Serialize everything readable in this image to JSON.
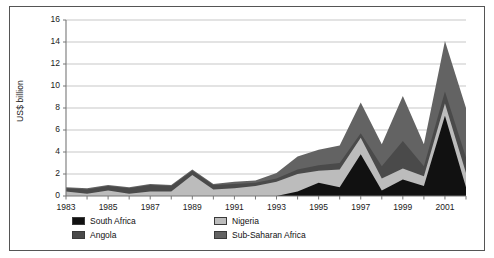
{
  "chart_data": {
    "type": "area",
    "title": "",
    "subtitle": "",
    "xlabel": "",
    "ylabel": "US$ billion",
    "ylim": [
      0,
      16
    ],
    "yticks": [
      0,
      2,
      4,
      6,
      8,
      10,
      12,
      14,
      16
    ],
    "ytick_labels": [
      "0",
      "2",
      "4",
      "6",
      "8",
      "10",
      "12",
      "14",
      "16"
    ],
    "xlim": [
      1983,
      2002
    ],
    "x": [
      1983,
      1984,
      1985,
      1986,
      1987,
      1988,
      1989,
      1990,
      1991,
      1992,
      1993,
      1994,
      1995,
      1996,
      1997,
      1998,
      1999,
      2000,
      2001,
      2002
    ],
    "xtick_labels": [
      "1983",
      "1985",
      "1987",
      "1989",
      "1991",
      "1993",
      "1995",
      "1997",
      "1999",
      "2001"
    ],
    "xticks_major": [
      1983,
      1985,
      1987,
      1989,
      1991,
      1993,
      1995,
      1997,
      1999,
      2001
    ],
    "grid": true,
    "grid_axis": "y",
    "legend_position": "below",
    "stacked": true,
    "stack_order": [
      "South Africa",
      "Nigeria",
      "Angola",
      "Sub-Saharan Africa"
    ],
    "series": [
      {
        "name": "South Africa",
        "color": "#111111",
        "values": [
          0.0,
          0.0,
          0.0,
          0.0,
          0.0,
          0.0,
          0.0,
          0.0,
          0.0,
          0.0,
          0.0,
          0.4,
          1.2,
          0.8,
          3.8,
          0.5,
          1.5,
          0.9,
          7.3,
          0.8
        ]
      },
      {
        "name": "Nigeria",
        "color": "#bcbcbc",
        "values": [
          0.4,
          0.2,
          0.5,
          0.2,
          0.4,
          0.4,
          1.9,
          0.6,
          0.7,
          0.9,
          1.3,
          1.6,
          1.1,
          1.6,
          1.5,
          1.1,
          1.0,
          0.9,
          1.1,
          1.3
        ]
      },
      {
        "name": "Angola",
        "color": "#4a4a4a",
        "values": [
          0.3,
          0.4,
          0.4,
          0.5,
          0.6,
          0.5,
          0.4,
          0.4,
          0.4,
          0.3,
          0.3,
          0.4,
          0.5,
          0.6,
          0.4,
          1.1,
          2.5,
          0.9,
          1.1,
          1.4
        ]
      },
      {
        "name": "Sub-Saharan Africa",
        "color": "#636363",
        "values": [
          0.1,
          0.1,
          0.1,
          0.1,
          0.1,
          0.1,
          0.1,
          0.1,
          0.2,
          0.2,
          0.5,
          1.2,
          1.4,
          1.6,
          2.8,
          2.0,
          4.1,
          2.0,
          4.6,
          4.5
        ]
      }
    ],
    "totals": [
      0.8,
      0.7,
      1.0,
      0.8,
      1.1,
      1.0,
      2.4,
      1.1,
      1.3,
      1.4,
      2.1,
      3.6,
      4.2,
      4.6,
      8.5,
      4.7,
      9.1,
      4.7,
      14.1,
      8.0
    ]
  },
  "legend": {
    "items": [
      {
        "label": "South Africa",
        "color": "#111111"
      },
      {
        "label": "Nigeria",
        "color": "#bcbcbc"
      },
      {
        "label": "Angola",
        "color": "#4a4a4a"
      },
      {
        "label": "Sub-Saharan Africa",
        "color": "#636363"
      }
    ]
  },
  "axis": {
    "ylabel": "US$ billion"
  }
}
